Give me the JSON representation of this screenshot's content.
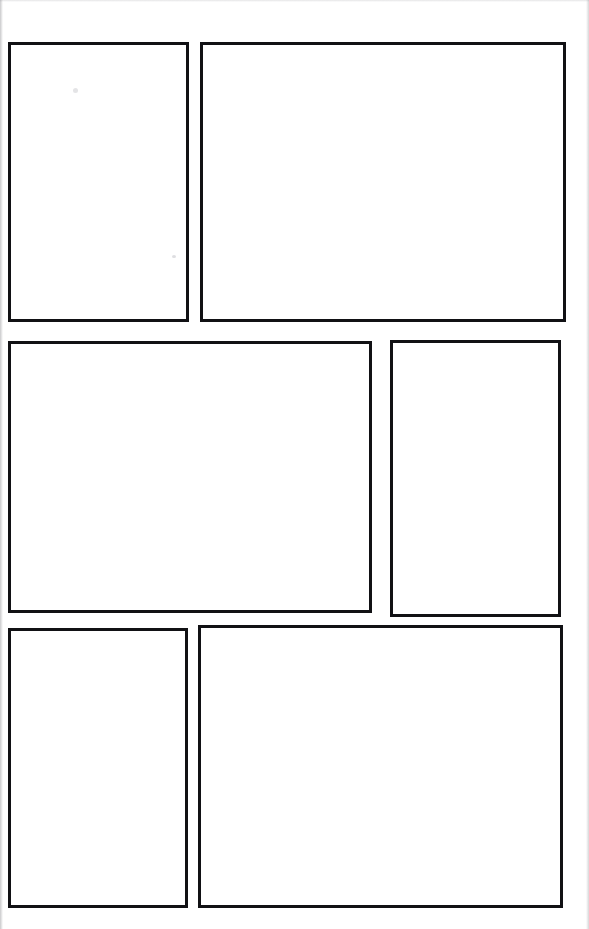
{
  "document": {
    "kind": "blank-panel-page",
    "description": "Scanned blank comic / storyboard page with six empty rectangular panels",
    "background_color": "#ffffff",
    "border_color": "#111114",
    "page_width": 589,
    "page_height": 929
  },
  "panels": [
    {
      "id": "panel-1",
      "row": 1,
      "position": "left",
      "content": "",
      "x": 8,
      "y": 42,
      "width": 181,
      "height": 280,
      "border_width": 3
    },
    {
      "id": "panel-2",
      "row": 1,
      "position": "right",
      "content": "",
      "x": 200,
      "y": 42,
      "width": 366,
      "height": 280,
      "border_width": 3
    },
    {
      "id": "panel-3",
      "row": 2,
      "position": "left",
      "content": "",
      "x": 8,
      "y": 341,
      "width": 364,
      "height": 272,
      "border_width": 3
    },
    {
      "id": "panel-4",
      "row": 2,
      "position": "right",
      "content": "",
      "x": 390,
      "y": 340,
      "width": 171,
      "height": 277,
      "border_width": 3
    },
    {
      "id": "panel-5",
      "row": 3,
      "position": "left",
      "content": "",
      "x": 8,
      "y": 628,
      "width": 180,
      "height": 280,
      "border_width": 3
    },
    {
      "id": "panel-6",
      "row": 3,
      "position": "right",
      "content": "",
      "x": 198,
      "y": 625,
      "width": 365,
      "height": 283,
      "border_width": 3
    }
  ],
  "artifacts": {
    "speckle_a": "",
    "speckle_b": ""
  }
}
